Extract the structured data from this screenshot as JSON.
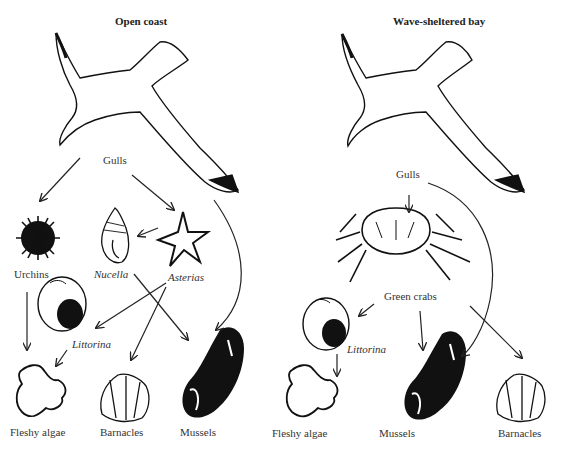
{
  "panels": [
    {
      "title": "Open coast",
      "labels": {
        "gulls": "Gulls",
        "urchins": "Urchins",
        "nucella": "Nucella",
        "asterias": "Asterias",
        "littorina": "Littorina",
        "fleshy_algae": "Fleshy algae",
        "barnacles": "Barnacles",
        "mussels": "Mussels"
      },
      "links": [
        {
          "from": "Gulls",
          "to": "Urchins"
        },
        {
          "from": "Gulls",
          "to": "Asterias"
        },
        {
          "from": "Gulls",
          "to": "Mussels"
        },
        {
          "from": "Asterias",
          "to": "Nucella"
        },
        {
          "from": "Asterias",
          "to": "Littorina"
        },
        {
          "from": "Asterias",
          "to": "Barnacles"
        },
        {
          "from": "Nucella",
          "to": "Mussels"
        },
        {
          "from": "Urchins",
          "to": "Fleshy algae"
        },
        {
          "from": "Littorina",
          "to": "Fleshy algae"
        }
      ]
    },
    {
      "title": "Wave-sheltered bay",
      "labels": {
        "gulls": "Gulls",
        "green_crabs": "Green crabs",
        "littorina": "Littorina",
        "fleshy_algae": "Fleshy algae",
        "mussels": "Mussels",
        "barnacles": "Barnacles"
      },
      "links": [
        {
          "from": "Gulls",
          "to": "Green crabs"
        },
        {
          "from": "Gulls",
          "to": "Mussels"
        },
        {
          "from": "Green crabs",
          "to": "Littorina"
        },
        {
          "from": "Green crabs",
          "to": "Mussels"
        },
        {
          "from": "Green crabs",
          "to": "Barnacles"
        },
        {
          "from": "Littorina",
          "to": "Fleshy algae"
        }
      ]
    }
  ]
}
